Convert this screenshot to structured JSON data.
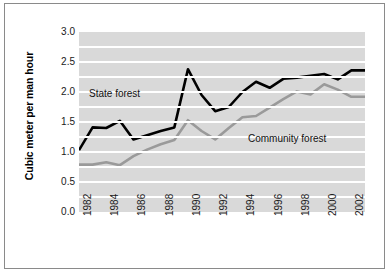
{
  "chart_data": {
    "type": "line",
    "title": "",
    "xlabel": "",
    "ylabel": "Cubic meter per man hour",
    "xlim": [
      1982,
      2003
    ],
    "ylim": [
      0.0,
      3.0
    ],
    "grid": true,
    "grid_orientation": "horizontal",
    "legend_position": "inline-annotations",
    "x": [
      1982,
      1983,
      1984,
      1985,
      1986,
      1987,
      1988,
      1989,
      1990,
      1991,
      1992,
      1993,
      1994,
      1995,
      1996,
      1997,
      1998,
      1999,
      2000,
      2001,
      2002,
      2003
    ],
    "xtick_labels": [
      "1982",
      "1984",
      "1986",
      "1988",
      "1990",
      "1992",
      "1994",
      "1996",
      "1998",
      "2000",
      "2002"
    ],
    "xticks": [
      1982,
      1984,
      1986,
      1988,
      1990,
      1992,
      1994,
      1996,
      1998,
      2000,
      2002
    ],
    "ytick_labels": [
      "0.0",
      "0.5",
      "1.0",
      "1.5",
      "2.0",
      "2.5",
      "3.0"
    ],
    "yticks": [
      0.0,
      0.5,
      1.0,
      1.5,
      2.0,
      2.5,
      3.0
    ],
    "gridlines": [
      0.25,
      0.5,
      0.75,
      1.0,
      1.25,
      1.5,
      1.75,
      2.0,
      2.25,
      2.5,
      2.75
    ],
    "series": [
      {
        "name": "State forest",
        "color": "#000000",
        "values": [
          1.03,
          1.41,
          1.4,
          1.52,
          1.21,
          1.28,
          1.35,
          1.41,
          2.38,
          1.95,
          1.68,
          1.75,
          2.0,
          2.17,
          2.07,
          2.22,
          2.24,
          2.27,
          2.3,
          2.21,
          2.36,
          2.36
        ]
      },
      {
        "name": "Community forest",
        "color": "#9a9a9a",
        "values": [
          0.79,
          0.79,
          0.83,
          0.78,
          0.93,
          1.04,
          1.13,
          1.2,
          1.53,
          1.35,
          1.21,
          1.4,
          1.58,
          1.6,
          1.74,
          1.88,
          2.01,
          1.96,
          2.13,
          2.04,
          1.92,
          1.92
        ]
      }
    ],
    "annotations": [
      {
        "text": "State forest",
        "series": "State forest"
      },
      {
        "text": "Community forest",
        "series": "Community forest"
      }
    ],
    "colors": {
      "plot_background": "#d9d9d9",
      "gridline": "#ffffff",
      "page_background": "#ffffff",
      "frame_border": "#8a8a8a",
      "text": "#1a1a1a"
    }
  }
}
